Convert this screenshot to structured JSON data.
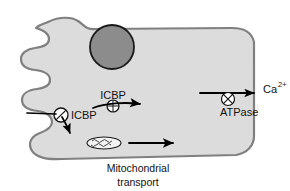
{
  "figure": {
    "background_color": "#ffffff"
  },
  "colors": {
    "cytoplasm_fill": "#dcdcdc",
    "membrane_stroke": "#808080",
    "nucleus_fill": "#8c8c8c",
    "nucleus_stroke": "#1a1a1a",
    "arrow_color": "#000000",
    "text_color": "#111111",
    "organelle_fill": "#f2f2f2"
  },
  "cell": {
    "name": "cell-body",
    "membrane_label": "plasma membrane",
    "cytoplasm_label": "cytoplasm"
  },
  "organelles": {
    "nucleus": {
      "label": "nucleus",
      "cx": 112,
      "cy": 47,
      "r": 22
    },
    "mitochondrion": {
      "label": "mitochondrion",
      "cx": 104,
      "cy": 143,
      "rx": 17,
      "ry": 6
    }
  },
  "labels": {
    "icbp_membrane": "ICBP",
    "icbp_cytosol": "ICBP",
    "atpase": "ATPase",
    "calcium": "Ca",
    "calcium_charge": "2+",
    "mitochondrial_transport_line1": "Mitochondrial",
    "mitochondrial_transport_line2": "transport"
  },
  "symbols": {
    "membrane_channel": {
      "name": "slashed-circle-icon",
      "description": "circle with diagonal slash (membrane transporter)",
      "cx": 61,
      "cy": 115,
      "r": 7
    },
    "cytosolic_carrier": {
      "name": "crosshatch-circle-icon",
      "description": "circle with vertical and horizontal crosshatch (ICBP carrier)",
      "cx": 113,
      "cy": 106,
      "r": 6
    },
    "atpase_pump": {
      "name": "crossed-circle-icon",
      "description": "circle with X inside (Ca2+ ATPase pump)",
      "cx": 228,
      "cy": 99,
      "r": 6.5
    }
  },
  "arrows": [
    {
      "name": "calcium-influx-arrow",
      "description": "arrow entering cell through membrane channel, bending downward into cytosol"
    },
    {
      "name": "icbp-transport-arrow",
      "description": "horizontal arrow to the right beneath ICBP label in cytosol"
    },
    {
      "name": "mitochondrial-transport-arrow",
      "description": "horizontal arrow to the right from the mitochondrion"
    },
    {
      "name": "calcium-efflux-arrow",
      "description": "horizontal arrow to the right exiting the cell through the ATPase pump"
    }
  ]
}
